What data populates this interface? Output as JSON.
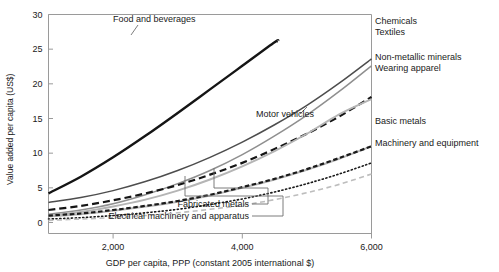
{
  "chart_data": {
    "type": "line",
    "title": "",
    "xlabel": "GDP per capita, PPP (constant 2005 international $)",
    "ylabel": "Value added per capita (US$)",
    "xlim": [
      1000,
      6000
    ],
    "ylim": [
      0,
      30
    ],
    "xticks": [
      2000,
      4000,
      6000
    ],
    "xticklabels": [
      "2,000",
      "4,000",
      "6,000"
    ],
    "yticks": [
      0,
      5,
      10,
      15,
      20,
      25,
      30
    ],
    "yticklabels": [
      "0",
      "5",
      "10",
      "15",
      "20",
      "25",
      "30"
    ],
    "grid": false,
    "legend": "inline-annotations",
    "x": [
      1000,
      1500,
      2000,
      2500,
      3000,
      3500,
      4000,
      4500,
      5000,
      5500,
      6000
    ],
    "series": [
      {
        "name": "Food and beverages",
        "style": "solid",
        "color": "#151515",
        "width": 2.4,
        "values": [
          4.2,
          6.6,
          9.4,
          12.5,
          15.8,
          19.2,
          22.6,
          26.0,
          27.2,
          27.2,
          27.2
        ],
        "truncated_at_x": 4550,
        "label_position": "above-line"
      },
      {
        "name": "Chemicals",
        "style": "solid",
        "color": "#4d4d4d",
        "width": 1.5,
        "values": [
          2.9,
          3.6,
          4.6,
          5.9,
          7.5,
          9.4,
          11.6,
          14.1,
          16.9,
          20.1,
          23.6
        ],
        "label_position": "right"
      },
      {
        "name": "Textiles",
        "style": "solid",
        "color": "#8f8f8f",
        "width": 1.5,
        "values": [
          1.2,
          1.8,
          2.7,
          4.0,
          5.6,
          7.5,
          9.8,
          12.5,
          15.5,
          18.9,
          22.6
        ],
        "label_position": "right"
      },
      {
        "name": "Non-metallic minerals",
        "style": "dashed",
        "color": "#151515",
        "width": 2.2,
        "values": [
          1.8,
          2.4,
          3.2,
          4.2,
          5.4,
          6.9,
          8.6,
          10.6,
          12.8,
          15.3,
          18.1
        ],
        "label_position": "right"
      },
      {
        "name": "Wearing apparel",
        "style": "solid",
        "color": "#b5b5b5",
        "width": 2.0,
        "values": [
          1.0,
          1.5,
          2.3,
          3.3,
          4.6,
          6.2,
          8.1,
          10.3,
          12.8,
          15.6,
          17.8
        ],
        "label_position": "right"
      },
      {
        "name": "Motor vehicles",
        "style": "solid",
        "color": "#151515",
        "width": 2.4,
        "values": [
          4.2,
          6.6,
          9.4,
          12.5,
          15.8,
          19.2,
          22.6,
          26.0,
          27.2,
          27.2,
          27.2
        ],
        "label_position": "leader-to-dashed",
        "note": "annotation label with leader line pointing to the black dashed curve"
      },
      {
        "name": "Basic metals",
        "style": "solid",
        "color": "#b5b5b5",
        "width": 2.0,
        "values": [
          0.9,
          1.2,
          1.7,
          2.3,
          3.0,
          3.9,
          5.0,
          6.2,
          7.6,
          9.2,
          11.0
        ],
        "label_position": "right"
      },
      {
        "name": "Machinery and equipment",
        "style": "dotted",
        "color": "#1a1a1a",
        "width": 1.6,
        "values": [
          0.5,
          0.7,
          1.0,
          1.4,
          1.9,
          2.6,
          3.4,
          4.4,
          5.6,
          7.0,
          8.6
        ],
        "label_position": "right"
      },
      {
        "name": "Fabricated metals",
        "style": "dashed-dotted",
        "color": "#1a1a1a",
        "width": 2.2,
        "values": [
          1.0,
          1.3,
          1.8,
          2.4,
          3.1,
          4.0,
          5.1,
          6.3,
          7.7,
          9.3,
          11.0
        ],
        "label_position": "leader-below"
      },
      {
        "name": "Electrical machinery and apparatus",
        "style": "dashed",
        "color": "#bdbdbd",
        "width": 1.6,
        "values": [
          0.3,
          0.5,
          0.7,
          1.0,
          1.4,
          1.9,
          2.5,
          3.3,
          4.3,
          5.5,
          7.0
        ],
        "label_position": "leader-below"
      }
    ],
    "annotations": [
      {
        "name": "Food and beverages",
        "x": 113,
        "y": 22,
        "anchor": "start"
      },
      {
        "name": "Chemicals",
        "x": 375,
        "y": 24,
        "anchor": "start"
      },
      {
        "name": "Textiles",
        "x": 375,
        "y": 35,
        "anchor": "start"
      },
      {
        "name": "Non-metallic minerals",
        "x": 375,
        "y": 60,
        "anchor": "start"
      },
      {
        "name": "Wearing apparel",
        "x": 375,
        "y": 71,
        "anchor": "start"
      },
      {
        "name": "Motor vehicles",
        "x": 256,
        "y": 117,
        "anchor": "start"
      },
      {
        "name": "Basic metals",
        "x": 375,
        "y": 124,
        "anchor": "start"
      },
      {
        "name": "Machinery and equipment",
        "x": 375,
        "y": 146,
        "anchor": "start"
      },
      {
        "name": "Fabricated metals",
        "x": 249,
        "y": 207,
        "anchor": "end"
      },
      {
        "name": "Electrical machinery and apparatus",
        "x": 249,
        "y": 219,
        "anchor": "end"
      }
    ]
  }
}
